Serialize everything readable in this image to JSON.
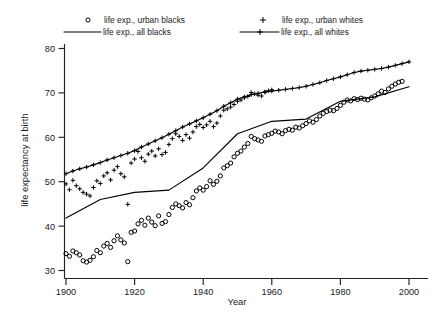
{
  "chart_data": {
    "type": "scatter",
    "title": "",
    "xlabel": "Year",
    "ylabel": "life expectancy at birth",
    "xlim": [
      1900,
      2000
    ],
    "ylim": [
      30,
      80
    ],
    "xticks": [
      1900,
      1920,
      1940,
      1960,
      1980,
      2000
    ],
    "yticks": [
      30,
      40,
      50,
      60,
      70,
      80
    ],
    "grid": false,
    "legend_position": "top",
    "legend": [
      {
        "label": "life exp., urban blacks",
        "marker": "circle",
        "line": false
      },
      {
        "label": "life exp., all blacks",
        "marker": "none",
        "line": true
      },
      {
        "label": "life exp., urban whites",
        "marker": "plus",
        "line": false
      },
      {
        "label": "life exp., all whites",
        "marker": "plus",
        "line": true
      }
    ],
    "series": [
      {
        "name": "life exp., urban blacks",
        "marker": "circle",
        "line": false,
        "x": [
          1900,
          1901,
          1902,
          1903,
          1904,
          1905,
          1906,
          1907,
          1908,
          1909,
          1910,
          1911,
          1912,
          1913,
          1914,
          1915,
          1916,
          1917,
          1918,
          1919,
          1920,
          1921,
          1922,
          1923,
          1924,
          1925,
          1926,
          1927,
          1928,
          1929,
          1930,
          1931,
          1932,
          1933,
          1934,
          1935,
          1936,
          1937,
          1938,
          1939,
          1940,
          1941,
          1942,
          1943,
          1944,
          1945,
          1946,
          1947,
          1948,
          1949,
          1950,
          1951,
          1952,
          1953,
          1954,
          1955,
          1956,
          1957,
          1958,
          1959,
          1960,
          1961,
          1962,
          1963,
          1964,
          1965,
          1966,
          1967,
          1968,
          1969,
          1970,
          1971,
          1972,
          1973,
          1974,
          1975,
          1976,
          1977,
          1978,
          1979,
          1980,
          1981,
          1982,
          1983,
          1984,
          1985,
          1986,
          1987,
          1988,
          1989,
          1990,
          1991,
          1992,
          1993,
          1994,
          1995,
          1996,
          1997,
          1998
        ],
        "y": [
          33.8,
          33.2,
          34.4,
          34.0,
          33.5,
          32.2,
          31.9,
          32.3,
          33.1,
          34.5,
          34.0,
          35.5,
          36.1,
          35.2,
          36.7,
          37.8,
          36.9,
          36.2,
          32.0,
          38.6,
          38.9,
          40.5,
          41.3,
          40.2,
          41.8,
          40.9,
          40.1,
          42.3,
          40.6,
          41.0,
          42.6,
          44.2,
          45.0,
          44.6,
          44.1,
          45.3,
          44.8,
          46.4,
          47.9,
          48.6,
          48.1,
          48.9,
          50.2,
          49.4,
          50.1,
          51.3,
          53.1,
          53.6,
          54.2,
          55.6,
          56.4,
          56.9,
          57.8,
          58.6,
          60.2,
          59.7,
          59.4,
          59.1,
          60.3,
          60.6,
          60.9,
          61.4,
          61.2,
          60.8,
          61.5,
          61.8,
          61.6,
          62.3,
          62.1,
          62.6,
          63.1,
          63.7,
          63.4,
          64.0,
          64.8,
          65.4,
          65.8,
          66.1,
          66.0,
          66.5,
          67.2,
          67.9,
          68.4,
          68.2,
          68.7,
          68.5,
          68.8,
          68.6,
          68.4,
          68.9,
          69.3,
          69.8,
          70.4,
          70.1,
          70.9,
          71.5,
          72.0,
          72.4,
          72.6
        ]
      },
      {
        "name": "life exp., all blacks",
        "marker": "none",
        "line": true,
        "x": [
          1900,
          1910,
          1920,
          1930,
          1940,
          1950,
          1960,
          1970,
          1980,
          1990,
          2000
        ],
        "y": [
          41.8,
          46.0,
          47.6,
          48.1,
          53.1,
          60.8,
          63.6,
          64.1,
          68.1,
          69.1,
          71.4
        ]
      },
      {
        "name": "life exp., urban whites",
        "marker": "plus",
        "line": false,
        "x": [
          1900,
          1901,
          1902,
          1903,
          1904,
          1905,
          1906,
          1907,
          1908,
          1909,
          1910,
          1911,
          1912,
          1913,
          1914,
          1915,
          1916,
          1917,
          1918,
          1919,
          1920,
          1921,
          1922,
          1923,
          1924,
          1925,
          1926,
          1927,
          1928,
          1929,
          1930,
          1931,
          1932,
          1933,
          1934,
          1935,
          1936,
          1937,
          1938,
          1939,
          1940,
          1941,
          1942,
          1943,
          1944,
          1945,
          1946,
          1947,
          1948,
          1949,
          1950,
          1951,
          1952,
          1953,
          1954,
          1955,
          1956,
          1957,
          1958,
          1959,
          1960
        ],
        "y": [
          49.5,
          48.2,
          50.3,
          49.1,
          48.4,
          47.6,
          47.2,
          46.8,
          48.7,
          50.2,
          49.6,
          51.3,
          52.0,
          50.4,
          52.6,
          53.4,
          51.8,
          51.1,
          44.9,
          54.2,
          55.1,
          56.8,
          55.4,
          54.6,
          56.2,
          56.9,
          55.8,
          57.4,
          56.1,
          56.6,
          58.4,
          59.7,
          60.8,
          60.2,
          59.3,
          60.6,
          59.8,
          61.2,
          62.4,
          62.9,
          62.2,
          62.8,
          63.6,
          62.4,
          63.2,
          64.8,
          66.1,
          66.4,
          66.8,
          67.4,
          68.1,
          68.4,
          68.9,
          69.2,
          70.1,
          69.8,
          69.5,
          69.3,
          70.2,
          70.5,
          70.7
        ]
      },
      {
        "name": "life exp., all whites",
        "marker": "plus",
        "line": true,
        "x": [
          1900,
          1902,
          1904,
          1906,
          1908,
          1910,
          1912,
          1914,
          1916,
          1918,
          1920,
          1922,
          1924,
          1926,
          1928,
          1930,
          1932,
          1934,
          1936,
          1938,
          1940,
          1942,
          1944,
          1946,
          1948,
          1950,
          1952,
          1954,
          1956,
          1958,
          1960,
          1962,
          1964,
          1966,
          1968,
          1970,
          1972,
          1974,
          1976,
          1978,
          1980,
          1982,
          1984,
          1986,
          1988,
          1990,
          1992,
          1994,
          1996,
          1998,
          2000
        ],
        "y": [
          51.8,
          52.4,
          52.9,
          53.3,
          53.8,
          54.3,
          54.9,
          55.4,
          55.9,
          56.4,
          57.0,
          57.8,
          58.5,
          59.2,
          59.9,
          60.7,
          61.5,
          62.3,
          63.0,
          63.7,
          64.4,
          65.2,
          66.0,
          67.0,
          67.8,
          68.6,
          69.1,
          69.6,
          69.9,
          70.2,
          70.4,
          70.6,
          70.8,
          71.0,
          71.2,
          71.5,
          71.9,
          72.3,
          72.8,
          73.2,
          73.6,
          74.1,
          74.6,
          74.9,
          75.1,
          75.3,
          75.5,
          75.8,
          76.2,
          76.6,
          77.0
        ]
      }
    ]
  },
  "axis": {
    "ylabel": "life expectancy at birth",
    "xlabel": "Year",
    "ytick_labels": [
      "80",
      "70",
      "60",
      "50",
      "40",
      "30"
    ],
    "xtick_labels": [
      "1900",
      "1920",
      "1940",
      "1960",
      "1980",
      "2000"
    ]
  },
  "legend": {
    "items": [
      {
        "label": "life exp., urban blacks"
      },
      {
        "label": "life exp., all blacks"
      },
      {
        "label": "life exp., urban whites"
      },
      {
        "label": "life exp., all whites"
      }
    ]
  }
}
